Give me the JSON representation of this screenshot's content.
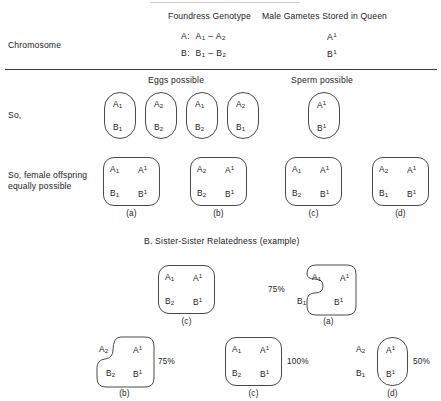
{
  "figure": {
    "top_headers": {
      "foundress": "Foundress Genotype",
      "male_gametes": "Male Gametes Stored in Queen"
    },
    "row_labels": {
      "chromosome": "Chromosome",
      "so": "So,",
      "female_offspring_line1": "So, female offspring",
      "female_offspring_line2": "equally possible"
    },
    "foundress_genotype": [
      {
        "chrom": "A:",
        "a1": "A",
        "a1sub": "1",
        "dash": "–",
        "a2": "A",
        "a2sub": "2"
      },
      {
        "chrom": "B:",
        "a1": "B",
        "a1sub": "1",
        "dash": "–",
        "a2": "B",
        "a2sub": "2"
      }
    ],
    "male_gametes": [
      {
        "allele": "A",
        "sup": "1"
      },
      {
        "allele": "B",
        "sup": "1"
      }
    ],
    "section_headers": {
      "eggs": "Eggs possible",
      "sperm": "Sperm possible",
      "sister": "B.  Sister-Sister Relatedness (example)"
    },
    "eggs": [
      {
        "top": "A",
        "topsub": "1",
        "bottom": "B",
        "bottomsub": "1"
      },
      {
        "top": "A",
        "topsub": "2",
        "bottom": "B",
        "bottomsub": "2"
      },
      {
        "top": "A",
        "topsub": "1",
        "bottom": "B",
        "bottomsub": "2"
      },
      {
        "top": "A",
        "topsub": "2",
        "bottom": "B",
        "bottomsub": "1"
      }
    ],
    "sperm": [
      {
        "top": "A",
        "topsup": "1",
        "bottom": "B",
        "bottomsup": "1"
      }
    ],
    "offspring": [
      {
        "caption": "(a)",
        "maternal_a": "A",
        "maternal_a_sub": "1",
        "maternal_b": "B",
        "maternal_b_sub": "1",
        "paternal_a": "A",
        "paternal_a_sup": "1",
        "paternal_b": "B",
        "paternal_b_sup": "1"
      },
      {
        "caption": "(b)",
        "maternal_a": "A",
        "maternal_a_sub": "2",
        "maternal_b": "B",
        "maternal_b_sub": "2",
        "paternal_a": "A",
        "paternal_a_sup": "1",
        "paternal_b": "B",
        "paternal_b_sup": "1"
      },
      {
        "caption": "(c)",
        "maternal_a": "A",
        "maternal_a_sub": "1",
        "maternal_b": "B",
        "maternal_b_sub": "2",
        "paternal_a": "A",
        "paternal_a_sup": "1",
        "paternal_b": "B",
        "paternal_b_sup": "1"
      },
      {
        "caption": "(d)",
        "maternal_a": "A",
        "maternal_a_sub": "2",
        "maternal_b": "B",
        "maternal_b_sub": "1",
        "paternal_a": "A",
        "paternal_a_sup": "1",
        "paternal_b": "B",
        "paternal_b_sup": "1"
      }
    ],
    "relatedness": [
      {
        "caption": "(c)",
        "percent": "",
        "shape": "full",
        "maternal_a": "A",
        "maternal_a_sub": "1",
        "maternal_b": "B",
        "maternal_b_sub": "2",
        "paternal_a": "A",
        "paternal_a_sup": "1",
        "paternal_b": "B",
        "paternal_b_sup": "1"
      },
      {
        "caption": "(a)",
        "percent": "75%",
        "shape": "notch-left",
        "maternal_a": "A",
        "maternal_a_sub": "1",
        "maternal_b": "B",
        "maternal_b_sub": "1",
        "paternal_a": "A",
        "paternal_a_sup": "1",
        "paternal_b": "B",
        "paternal_b_sup": "1"
      },
      {
        "caption": "(b)",
        "percent": "75%",
        "shape": "notch-upper-left",
        "maternal_a": "A",
        "maternal_a_sub": "2",
        "maternal_b": "B",
        "maternal_b_sub": "2",
        "paternal_a": "A",
        "paternal_a_sup": "1",
        "paternal_b": "B",
        "paternal_b_sup": "1"
      },
      {
        "caption": "(c)",
        "percent": "100%",
        "shape": "full",
        "maternal_a": "A",
        "maternal_a_sub": "1",
        "maternal_b": "B",
        "maternal_b_sub": "2",
        "paternal_a": "A",
        "paternal_a_sup": "1",
        "paternal_b": "B",
        "paternal_b_sup": "1"
      },
      {
        "caption": "(d)",
        "percent": "50%",
        "shape": "narrow",
        "maternal_a": "A",
        "maternal_a_sub": "2",
        "maternal_b": "B",
        "maternal_b_sub": "1",
        "paternal_a": "A",
        "paternal_a_sup": "1",
        "paternal_b": "B",
        "paternal_b_sup": "1"
      }
    ],
    "colors": {
      "ink": "#222222",
      "stroke": "#4a4a4a",
      "rule": "#3a3a3a",
      "background": "#ffffff"
    }
  }
}
